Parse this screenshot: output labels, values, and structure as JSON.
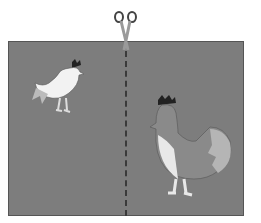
{
  "scene": {
    "description": "Gray paper with dashed cut line, scissors at top, small white rooster on left, larger gray hen on right",
    "colors": {
      "background": "#ffffff",
      "paper": "#7d7d7d",
      "cut_line": "#3a3a3a",
      "rooster_body": "#f2f2f2",
      "hen_body": "#8a8a8a",
      "comb": "#222222"
    },
    "icons": [
      "scissors-icon",
      "rooster-icon",
      "hen-icon"
    ]
  }
}
